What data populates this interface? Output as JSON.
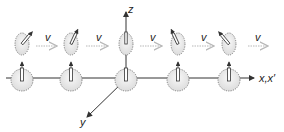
{
  "diagram": {
    "axes": {
      "x_label": "x,x′",
      "y_label": "y",
      "z_label": "z"
    },
    "velocity_labels": [
      "v",
      "v",
      "v",
      "v",
      "v"
    ],
    "stationary_clocks": [
      {
        "cx": 22,
        "cy": 80
      },
      {
        "cx": 71,
        "cy": 80
      },
      {
        "cx": 126,
        "cy": 80
      },
      {
        "cx": 178,
        "cy": 80
      },
      {
        "cx": 229,
        "cy": 80
      }
    ],
    "moving_clocks": [
      {
        "cx": 22,
        "cy": 44,
        "hand_angle": 40
      },
      {
        "cx": 71,
        "cy": 44,
        "hand_angle": 25
      },
      {
        "cx": 126,
        "cy": 44,
        "hand_angle": 0
      },
      {
        "cx": 178,
        "cy": 44,
        "hand_angle": -25
      },
      {
        "cx": 229,
        "cy": 44,
        "hand_angle": -40
      }
    ],
    "colors": {
      "line": "#333333",
      "clock_fill": "#eeeeee",
      "velocity_arrow": "#b8b8b8",
      "tick": "#888888"
    }
  }
}
